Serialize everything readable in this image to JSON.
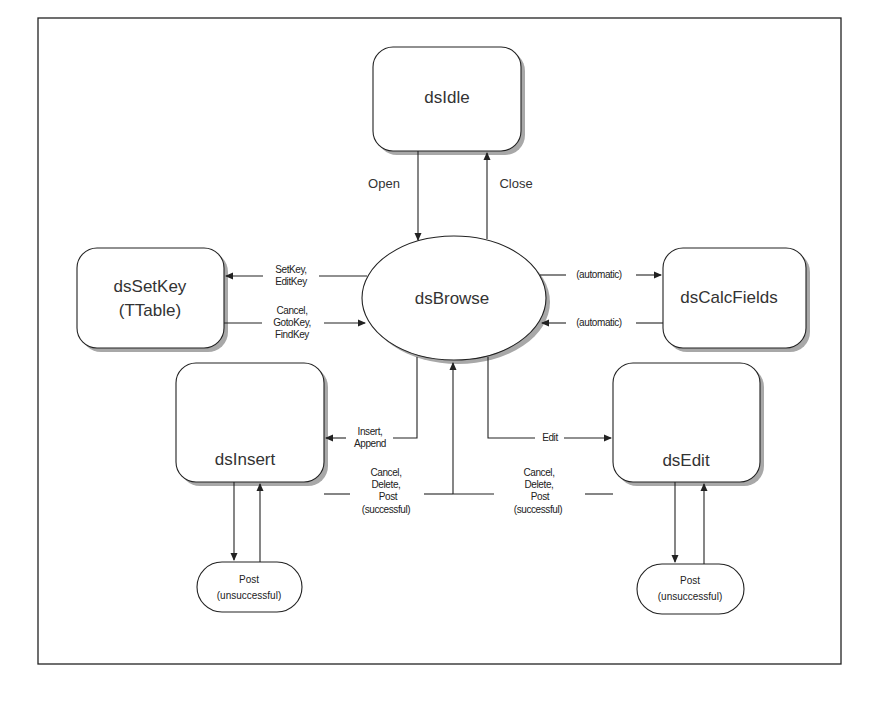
{
  "diagram": {
    "type": "state-transition",
    "nodes": {
      "idle": {
        "label": "dsIdle",
        "shape": "rounded-rect"
      },
      "browse": {
        "label": "dsBrowse",
        "shape": "ellipse"
      },
      "setkey": {
        "label_line1": "dsSetKey",
        "label_line2": "(TTable)",
        "shape": "rounded-rect"
      },
      "calcfields": {
        "label": "dsCalcFields",
        "shape": "rounded-rect"
      },
      "insert": {
        "label": "dsInsert",
        "shape": "rounded-rect"
      },
      "edit": {
        "label": "dsEdit",
        "shape": "rounded-rect"
      },
      "post_fail_insert": {
        "label_line1": "Post",
        "label_line2": "(unsuccessful)",
        "shape": "pill"
      },
      "post_fail_edit": {
        "label_line1": "Post",
        "label_line2": "(unsuccessful)",
        "shape": "pill"
      }
    },
    "edges": {
      "open": {
        "from": "dsIdle",
        "to": "dsBrowse",
        "label": "Open"
      },
      "close": {
        "from": "dsBrowse",
        "to": "dsIdle",
        "label": "Close"
      },
      "to_setkey": {
        "from": "dsBrowse",
        "to": "dsSetKey",
        "label_line1": "SetKey,",
        "label_line2": "EditKey"
      },
      "from_setkey": {
        "from": "dsSetKey",
        "to": "dsBrowse",
        "label_line1": "Cancel,",
        "label_line2": "GotoKey,",
        "label_line3": "FindKey"
      },
      "to_calc": {
        "from": "dsBrowse",
        "to": "dsCalcFields",
        "label": "(automatic)"
      },
      "from_calc": {
        "from": "dsCalcFields",
        "to": "dsBrowse",
        "label": "(automatic)"
      },
      "to_insert": {
        "from": "dsBrowse",
        "to": "dsInsert",
        "label_line1": "Insert,",
        "label_line2": "Append"
      },
      "to_edit": {
        "from": "dsBrowse",
        "to": "dsEdit",
        "label": "Edit"
      },
      "from_insert": {
        "from": "dsInsert",
        "to": "dsBrowse",
        "label_line1": "Cancel,",
        "label_line2": "Delete,",
        "label_line3": "Post",
        "label_line4": "(successful)"
      },
      "from_edit": {
        "from": "dsEdit",
        "to": "dsBrowse",
        "label_line1": "Cancel,",
        "label_line2": "Delete,",
        "label_line3": "Post",
        "label_line4": "(successful)"
      },
      "insert_post_loop": {
        "from": "dsInsert",
        "to": "Post (unsuccessful)"
      },
      "edit_post_loop": {
        "from": "dsEdit",
        "to": "Post (unsuccessful)"
      }
    },
    "colors": {
      "stroke": "#222222",
      "shadow": "#a8a8a8",
      "background": "#ffffff"
    }
  }
}
